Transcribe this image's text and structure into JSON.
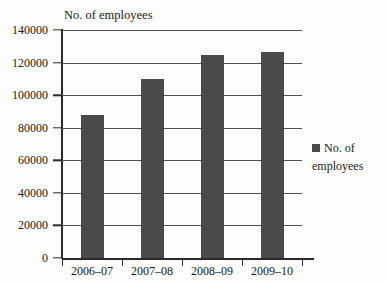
{
  "chart_data": {
    "type": "bar",
    "title": "No. of employees",
    "xlabel": "",
    "ylabel": "",
    "categories": [
      "2006–07",
      "2007–08",
      "2008–09",
      "2009–10"
    ],
    "values": [
      88000,
      110000,
      124500,
      126500
    ],
    "series": [
      {
        "name": "No. of employees",
        "values": [
          88000,
          110000,
          124500,
          126500
        ]
      }
    ],
    "ylim": [
      0,
      140000
    ],
    "ytick_values": [
      0,
      20000,
      40000,
      60000,
      80000,
      100000,
      120000,
      140000
    ],
    "ytick_labels": [
      "0",
      "20000",
      "40000",
      "60000",
      "80000",
      "100000",
      "120000",
      "140000"
    ],
    "grid": true,
    "grid_axis": "y",
    "legend": {
      "position": "right",
      "entries": [
        {
          "label": "No. of employees",
          "color": "#4a4a4a",
          "marker": "square"
        }
      ]
    },
    "bar_color": "#4a4a4a",
    "axis_color": "#2a2a2a",
    "gridline_color": "#4f4f4f",
    "background_color": "#fdfdfb"
  }
}
